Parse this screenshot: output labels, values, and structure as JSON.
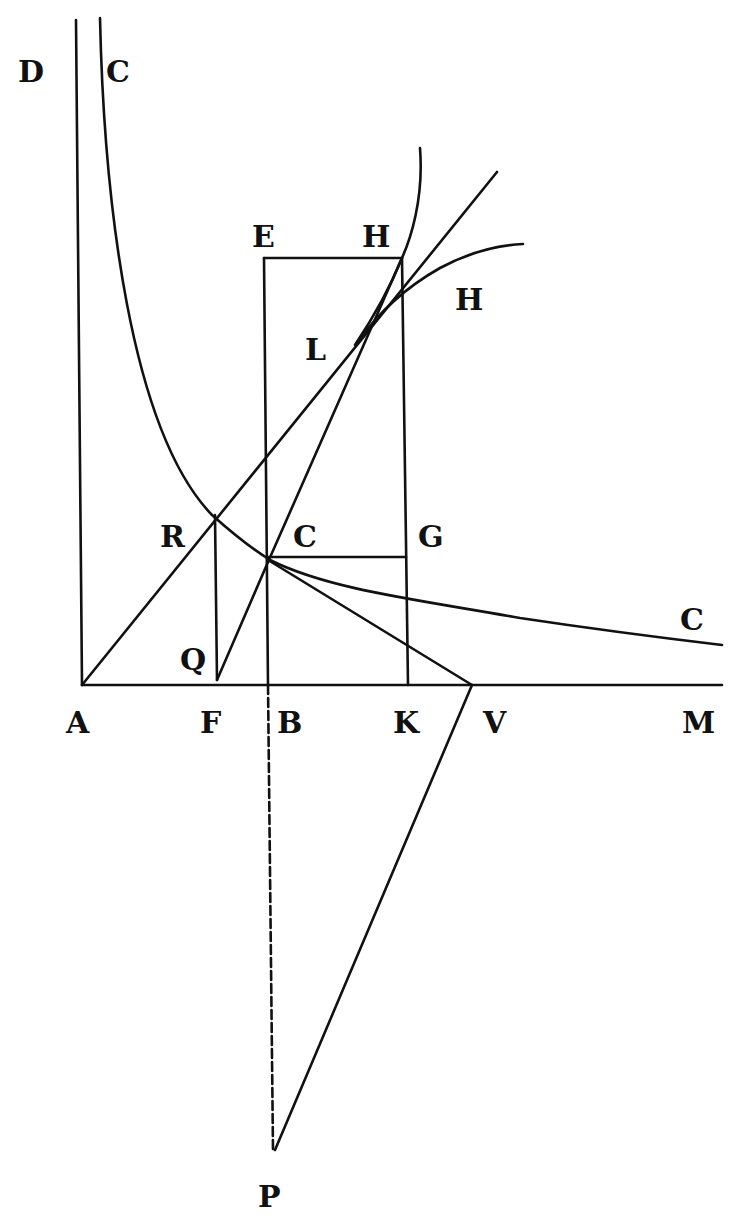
{
  "diagram": {
    "type": "geometric construction (hyperbola / logarithmic curves with tangents)",
    "colors": {
      "ink": "#111111",
      "paper": "#ffffff"
    },
    "labels": [
      {
        "id": "D",
        "text": "D",
        "x": 18,
        "y": 82
      },
      {
        "id": "C_top",
        "text": "C",
        "x": 106,
        "y": 82
      },
      {
        "id": "E",
        "text": "E",
        "x": 252,
        "y": 247
      },
      {
        "id": "H_top",
        "text": "H",
        "x": 362,
        "y": 247
      },
      {
        "id": "H_right",
        "text": "H",
        "x": 455,
        "y": 310
      },
      {
        "id": "L",
        "text": "L",
        "x": 305,
        "y": 360
      },
      {
        "id": "R",
        "text": "R",
        "x": 160,
        "y": 547
      },
      {
        "id": "C_mid",
        "text": "C",
        "x": 293,
        "y": 547
      },
      {
        "id": "G",
        "text": "G",
        "x": 418,
        "y": 547
      },
      {
        "id": "C_right",
        "text": "C",
        "x": 680,
        "y": 630
      },
      {
        "id": "Q",
        "text": "Q",
        "x": 180,
        "y": 670
      },
      {
        "id": "A",
        "text": "A",
        "x": 66,
        "y": 733
      },
      {
        "id": "F",
        "text": "F",
        "x": 200,
        "y": 733
      },
      {
        "id": "B",
        "text": "B",
        "x": 277,
        "y": 733
      },
      {
        "id": "K",
        "text": "K",
        "x": 393,
        "y": 733
      },
      {
        "id": "V",
        "text": "V",
        "x": 483,
        "y": 733
      },
      {
        "id": "M",
        "text": "M",
        "x": 682,
        "y": 733
      },
      {
        "id": "P",
        "text": "P",
        "x": 258,
        "y": 1207
      }
    ]
  }
}
